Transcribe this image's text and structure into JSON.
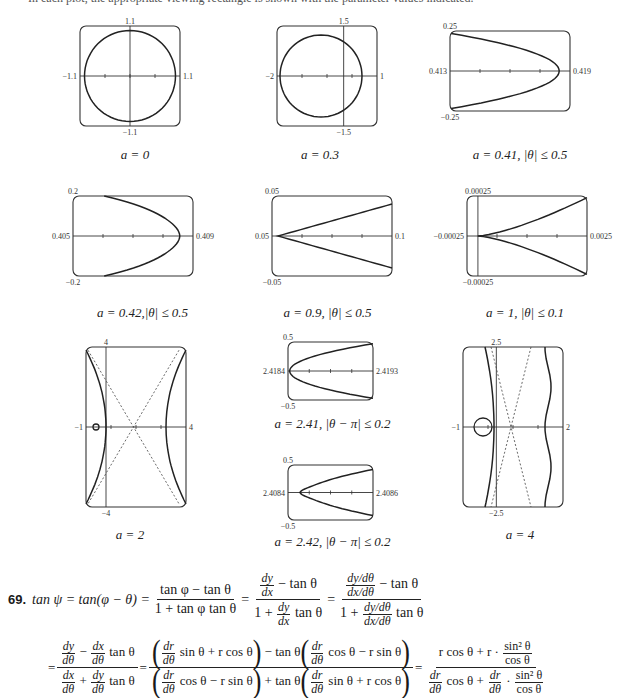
{
  "header": {
    "truncated_line": "In each plot, the appropriate viewing rectangle is shown with the parameter values indicated."
  },
  "chart_data": [
    {
      "id": "p1",
      "type": "line",
      "title": "a = 0",
      "caption": "a = 0",
      "xlim": [
        -1.1,
        1.1
      ],
      "ylim": [
        -1.1,
        1.1
      ],
      "tick_labels": {
        "left": "−1.1",
        "right": "1.1",
        "top": "1.1",
        "bottom": "−1.1"
      }
    },
    {
      "id": "p2",
      "type": "line",
      "title": "a = 0.3",
      "caption": "a = 0.3",
      "xlim": [
        -2,
        1
      ],
      "ylim": [
        -1.5,
        1.5
      ],
      "tick_labels": {
        "left": "−2",
        "right": "1",
        "top": "1.5",
        "bottom": "−1.5"
      }
    },
    {
      "id": "p3",
      "type": "line",
      "title": "a = 0.41, |θ| ≤ 0.5",
      "caption": "a = 0.41, |θ| ≤ 0.5",
      "xlim": [
        0.413,
        0.419
      ],
      "ylim": [
        -0.25,
        0.25
      ],
      "tick_labels": {
        "left": "0.413",
        "right": "0.419",
        "top": "0.25",
        "bottom": "−0.25"
      }
    },
    {
      "id": "p4",
      "type": "line",
      "title": "a = 0.42, |θ| ≤ 0.5",
      "caption": "a = 0.42,|θ| ≤ 0.5",
      "xlim": [
        0.405,
        0.409
      ],
      "ylim": [
        -0.2,
        0.2
      ],
      "tick_labels": {
        "left": "0.405",
        "right": "0.409",
        "top": "0.2",
        "bottom": "−0.2"
      }
    },
    {
      "id": "p5",
      "type": "line",
      "title": "a = 0.9, |θ| ≤ 0.5",
      "caption": "a = 0.9, |θ| ≤ 0.5",
      "xlim": [
        0.05,
        0.1
      ],
      "ylim": [
        -0.05,
        0.05
      ],
      "tick_labels": {
        "left": "0.05",
        "right": "0.1",
        "top": "0.05",
        "bottom": "−0.05"
      }
    },
    {
      "id": "p6",
      "type": "line",
      "title": "a = 1, |θ| ≤ 0.1",
      "caption": "a = 1, |θ| ≤ 0.1",
      "xlim": [
        -0.00025,
        0.0025
      ],
      "ylim": [
        -0.00025,
        0.00025
      ],
      "tick_labels": {
        "left": "−0.00025",
        "right": "0.0025",
        "top": "0.00025",
        "bottom": "−0.00025"
      }
    },
    {
      "id": "p7",
      "type": "line",
      "title": "a = 2",
      "caption": "a = 2",
      "xlim": [
        -1,
        4
      ],
      "ylim": [
        -4,
        4
      ],
      "tick_labels": {
        "left": "−1",
        "right": "4",
        "top": "4",
        "bottom": "−4"
      },
      "asymptotes": "dashed"
    },
    {
      "id": "p8",
      "type": "line",
      "title": "a = 2.41, |θ − π| ≤ 0.2",
      "caption": "a = 2.41, |θ − π| ≤ 0.2",
      "xlim": [
        2.4184,
        2.4193
      ],
      "ylim": [
        -0.5,
        0.5
      ],
      "tick_labels": {
        "left": "2.4184",
        "right": "2.4193",
        "top": "0.5",
        "bottom": "−0.5"
      }
    },
    {
      "id": "p9",
      "type": "line",
      "title": "a = 2.42, |θ − π| ≤ 0.2",
      "caption": "a = 2.42, |θ − π| ≤ 0.2",
      "xlim": [
        2.4084,
        2.4086
      ],
      "ylim": [
        -0.5,
        0.5
      ],
      "tick_labels": {
        "left": "2.4084",
        "right": "2.4086",
        "top": "0.5",
        "bottom": "−0.5"
      }
    },
    {
      "id": "p10",
      "type": "line",
      "title": "a = 4",
      "caption": "a = 4",
      "xlim": [
        -1,
        2
      ],
      "ylim": [
        -2.5,
        2.5
      ],
      "tick_labels": {
        "left": "−1",
        "right": "2",
        "top": "2.5",
        "bottom": "−2.5"
      },
      "asymptotes": "dashed"
    }
  ],
  "problem": {
    "number": "69.",
    "line1": {
      "lhs": "tan ψ = tan(φ − θ) =",
      "f1_num": "tan φ − tan θ",
      "f1_den": "1 + tan φ tan θ",
      "dy": "dy",
      "dx": "dx",
      "minus_tan": "− tan θ",
      "one_plus": "1 +",
      "tan_theta": "tan θ",
      "dy_dtheta": "dy/dθ",
      "dx_dtheta": "dx/dθ",
      "eq": "="
    },
    "line2": {
      "eq": "=",
      "dtheta": "dθ",
      "dy": "dy",
      "dx": "dx",
      "dr": "dr",
      "minus": "−",
      "plus": "+",
      "tan_theta": "tan θ",
      "sin_r_cos": "sin θ + r cos θ",
      "cos_r_sin": "cos θ − r sin θ",
      "minus_tan": "− tan θ",
      "plus_tan": "+ tan θ",
      "lparen": "(",
      "rparen": ")",
      "r_cos_plus_r": "r cos θ + r ·",
      "sin2": "sin² θ",
      "cos": "cos θ",
      "cos_theta_plus": "cos θ +",
      "dot": "·"
    }
  }
}
